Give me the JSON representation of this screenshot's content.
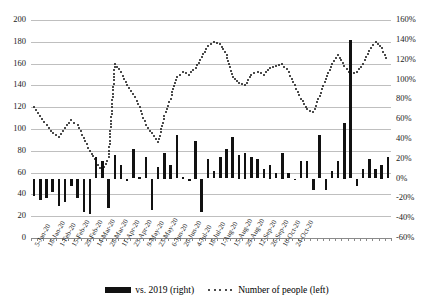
{
  "chart_data": {
    "type": "bar",
    "title": "",
    "subtitle": "",
    "xlabel": "",
    "ylabel": "",
    "grid": true,
    "legend_position": "bottom",
    "left_axis": {
      "label": "Number of people",
      "min": 0,
      "max": 200,
      "step": 20,
      "ticks": [
        "0",
        "20",
        "40",
        "60",
        "80",
        "100",
        "120",
        "140",
        "160",
        "180",
        "200"
      ]
    },
    "right_axis": {
      "label": "vs. 2019",
      "min": -60,
      "max": 160,
      "step": 20,
      "ticks": [
        "-60%",
        "-40%",
        "-20%",
        "0%",
        "20%",
        "40%",
        "60%",
        "80%",
        "100%",
        "120%",
        "140%",
        "160%"
      ]
    },
    "categories": [
      "5-Jan-20",
      "12-Jan-20",
      "19-Jan-20",
      "26-Jan-20",
      "2-Feb-20",
      "9-Feb-20",
      "16-Feb-20",
      "23-Feb-20",
      "1-Mar-20",
      "8-Mar-20",
      "15-Mar-20",
      "22-Mar-20",
      "29-Mar-20",
      "5-Apr-20",
      "12-Apr-20",
      "19-Apr-20",
      "26-Apr-20",
      "3-May-20",
      "10-May-20",
      "17-May-20",
      "24-May-20",
      "31-May-20",
      "7-Jun-20",
      "14-Jun-20",
      "21-Jun-20",
      "28-Jun-20",
      "5-Jul-20",
      "12-Jul-20",
      "19-Jul-20",
      "26-Jul-20",
      "2-Aug-20",
      "9-Aug-20",
      "16-Aug-20",
      "23-Aug-20",
      "30-Aug-20",
      "6-Sep-20",
      "13-Sep-20",
      "20-Sep-20",
      "27-Sep-20",
      "4-Oct-20",
      "11-Oct-20",
      "18-Oct-20",
      "25-Oct-20",
      "1-Nov-20",
      "8-Nov-20",
      "15-Nov-20",
      "22-Nov-20",
      "29-Nov-20",
      "6-Dec-20",
      "13-Dec-20",
      "20-Dec-20",
      "27-Dec-20",
      "3-Jan-21",
      "10-Jan-21",
      "17-Jan-21",
      "24-Jan-21",
      "31-Jan-21",
      "7-Feb-21"
    ],
    "x_tick_labels": [
      "5-Jan-20",
      "18-Jan-20",
      "1-Feb-20",
      "15-Feb-20",
      "29-Feb-20",
      "14-Mar-20",
      "28-Mar-20",
      "11-Apr-20",
      "25-Apr-20",
      "9-May-20",
      "23-May-20",
      "6-Jun-20",
      "20-Jun-20",
      "4-Jul-20",
      "18-Jul-20",
      "1-Aug-20",
      "15-Aug-20",
      "29-Aug-20",
      "12-Sep-20",
      "26-Sep-20",
      "10-Oct-20",
      "24-Oct-20"
    ],
    "x_tick_every": 2,
    "series": [
      {
        "name": "vs. 2019 (right)",
        "axis": "right",
        "type": "bar",
        "color": "#111111",
        "unit": "%",
        "values": [
          -18,
          -22,
          -20,
          -14,
          -28,
          -24,
          -8,
          -20,
          -34,
          -36,
          22,
          18,
          -30,
          24,
          14,
          -2,
          30,
          2,
          22,
          -32,
          12,
          26,
          14,
          44,
          2,
          -2,
          38,
          -34,
          20,
          8,
          22,
          30,
          42,
          24,
          26,
          22,
          20,
          10,
          14,
          6,
          26,
          6,
          -1,
          18,
          18,
          -12,
          44,
          -12,
          8,
          18,
          56,
          140,
          -8,
          10,
          20,
          10,
          14,
          22
        ]
      },
      {
        "name": "Number of people (left)",
        "axis": "left",
        "type": "line",
        "style": "dotted",
        "color": "#111111",
        "values": [
          120,
          112,
          104,
          96,
          93,
          101,
          108,
          104,
          92,
          80,
          70,
          62,
          74,
          160,
          152,
          140,
          132,
          120,
          104,
          96,
          88,
          112,
          128,
          148,
          152,
          150,
          156,
          166,
          176,
          180,
          178,
          168,
          148,
          142,
          140,
          150,
          152,
          150,
          156,
          158,
          160,
          152,
          140,
          128,
          118,
          116,
          130,
          146,
          160,
          168,
          158,
          150,
          152,
          160,
          172,
          180,
          174,
          162
        ]
      }
    ]
  },
  "legend": {
    "items": [
      {
        "label": "vs. 2019 (right)",
        "marker": "bar-swatch"
      },
      {
        "label": "Number of people (left)",
        "marker": "dotted-swatch"
      }
    ]
  }
}
